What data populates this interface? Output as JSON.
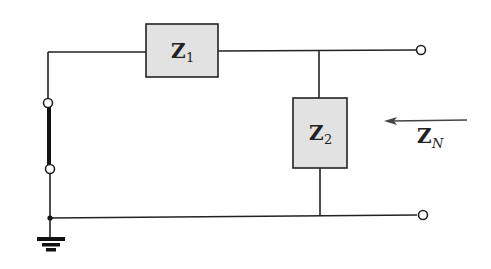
{
  "diagram": {
    "type": "circuit-schematic",
    "components": {
      "z1": {
        "main": "Z",
        "sub": "1"
      },
      "z2": {
        "main": "Z",
        "sub": "2"
      }
    },
    "arrow_label": {
      "main": "Z",
      "sub": "N"
    },
    "colors": {
      "box_fill": "#e2e2e2",
      "line": "#222222"
    }
  }
}
